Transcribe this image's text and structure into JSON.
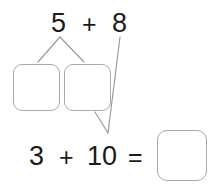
{
  "worksheet": {
    "type": "make-ten-number-bond-worksheet",
    "background_color": "#ffffff",
    "text_color": "#1b1b1b",
    "box_border_color": "#a9a9ac",
    "connector_color": "#9a9a9e",
    "top_equation": {
      "addend_a": "5",
      "operator": "+",
      "addend_b": "8"
    },
    "decomposition_boxes": [
      {
        "name": "part-1",
        "value": ""
      },
      {
        "name": "part-2",
        "value": ""
      }
    ],
    "bottom_equation": {
      "addend_a": "3",
      "operator": "+",
      "addend_b": "10",
      "equals": "=",
      "answer": ""
    },
    "connectors": [
      {
        "name": "five-to-part-1",
        "from": "top-addend-a",
        "to": "box-part-1",
        "points": "60,37 38,62"
      },
      {
        "name": "five-to-part-2",
        "from": "top-addend-a",
        "to": "box-part-2",
        "points": "60,37 84,62"
      },
      {
        "name": "eight-to-ten",
        "from": "top-addend-b",
        "to": "bottom-addend-b",
        "points": "120,37 108,133"
      },
      {
        "name": "part-2-to-ten",
        "from": "box-part-2",
        "to": "bottom-addend-b",
        "points": "95,112 108,133"
      }
    ]
  }
}
